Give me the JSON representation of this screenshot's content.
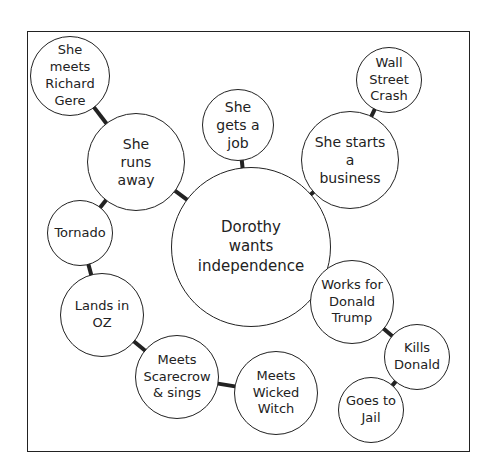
{
  "diagram": {
    "type": "bubble-map",
    "colors": {
      "stroke": "#222222",
      "fill": "#ffffff",
      "background": "#ffffff"
    },
    "frame": {
      "x": 27,
      "y": 31,
      "width": 443,
      "height": 421
    },
    "nodes": [
      {
        "id": "center",
        "label": "Dorothy\nwants\nindependence",
        "cx": 251,
        "cy": 247,
        "r": 80,
        "font": 15
      },
      {
        "id": "runs_away",
        "label": "She\nruns\naway",
        "cx": 136,
        "cy": 162,
        "r": 49,
        "font": 14
      },
      {
        "id": "richard_gere",
        "label": "She\nmeets\nRichard\nGere",
        "cx": 70,
        "cy": 76,
        "r": 40,
        "font": 13
      },
      {
        "id": "gets_job",
        "label": "She\ngets a\njob",
        "cx": 238,
        "cy": 125,
        "r": 36,
        "font": 14
      },
      {
        "id": "starts_business",
        "label": "She starts\na\nbusiness",
        "cx": 350,
        "cy": 160,
        "r": 49,
        "font": 14
      },
      {
        "id": "wall_street",
        "label": "Wall\nStreet\nCrash",
        "cx": 389,
        "cy": 80,
        "r": 33,
        "font": 13
      },
      {
        "id": "tornado",
        "label": "Tornado",
        "cx": 80,
        "cy": 233,
        "r": 33,
        "font": 13
      },
      {
        "id": "lands_oz",
        "label": "Lands in\nOZ",
        "cx": 102,
        "cy": 315,
        "r": 42,
        "font": 13
      },
      {
        "id": "scarecrow",
        "label": "Meets\nScarecrow\n& sings",
        "cx": 177,
        "cy": 377,
        "r": 42,
        "font": 13
      },
      {
        "id": "wicked_witch",
        "label": "Meets\nWicked\nWitch",
        "cx": 276,
        "cy": 393,
        "r": 42,
        "font": 13
      },
      {
        "id": "works_trump",
        "label": "Works for\nDonald\nTrump",
        "cx": 352,
        "cy": 302,
        "r": 42,
        "font": 13
      },
      {
        "id": "kills_donald",
        "label": "Kills\nDonald",
        "cx": 417,
        "cy": 357,
        "r": 33,
        "font": 13
      },
      {
        "id": "goes_jail",
        "label": "Goes to\nJail",
        "cx": 371,
        "cy": 410,
        "r": 33,
        "font": 13
      }
    ],
    "edges": [
      [
        "center",
        "runs_away"
      ],
      [
        "center",
        "gets_job"
      ],
      [
        "center",
        "starts_business"
      ],
      [
        "center",
        "works_trump"
      ],
      [
        "runs_away",
        "richard_gere"
      ],
      [
        "runs_away",
        "tornado"
      ],
      [
        "starts_business",
        "wall_street"
      ],
      [
        "tornado",
        "lands_oz"
      ],
      [
        "lands_oz",
        "scarecrow"
      ],
      [
        "scarecrow",
        "wicked_witch"
      ],
      [
        "works_trump",
        "kills_donald"
      ],
      [
        "kills_donald",
        "goes_jail"
      ]
    ]
  }
}
